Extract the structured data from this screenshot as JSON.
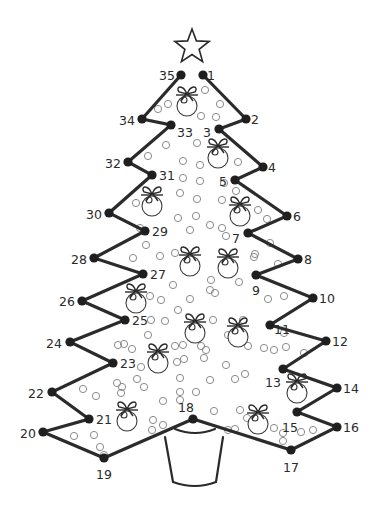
{
  "colors": {
    "line": "#2b2b2b",
    "node": "#1f1f1f",
    "bubble": "#8a8a8a",
    "background": "#ffffff"
  },
  "star": {
    "cx": 192,
    "cy": 47,
    "outer": 18,
    "inner": 7.5
  },
  "dots": [
    {
      "n": "1",
      "x": 203,
      "y": 75,
      "lx": 207,
      "ly": 80,
      "anchor": "start"
    },
    {
      "n": "2",
      "x": 246,
      "y": 119,
      "lx": 251,
      "ly": 124,
      "anchor": "start"
    },
    {
      "n": "3",
      "x": 219,
      "y": 129,
      "lx": 211,
      "ly": 137,
      "anchor": "end"
    },
    {
      "n": "4",
      "x": 263,
      "y": 167,
      "lx": 268,
      "ly": 172,
      "anchor": "start"
    },
    {
      "n": "5",
      "x": 235,
      "y": 180,
      "lx": 227,
      "ly": 186,
      "anchor": "end"
    },
    {
      "n": "6",
      "x": 287,
      "y": 216,
      "lx": 293,
      "ly": 221,
      "anchor": "start"
    },
    {
      "n": "7",
      "x": 248,
      "y": 233,
      "lx": 240,
      "ly": 243,
      "anchor": "end"
    },
    {
      "n": "8",
      "x": 298,
      "y": 259,
      "lx": 304,
      "ly": 264,
      "anchor": "start"
    },
    {
      "n": "9",
      "x": 256,
      "y": 275,
      "lx": 252,
      "ly": 295,
      "anchor": "start"
    },
    {
      "n": "10",
      "x": 313,
      "y": 298,
      "lx": 319,
      "ly": 303,
      "anchor": "start"
    },
    {
      "n": "11",
      "x": 270,
      "y": 325,
      "lx": 274,
      "ly": 334,
      "anchor": "start"
    },
    {
      "n": "12",
      "x": 326,
      "y": 341,
      "lx": 332,
      "ly": 346,
      "anchor": "start"
    },
    {
      "n": "13",
      "x": 283,
      "y": 369,
      "lx": 281,
      "ly": 387,
      "anchor": "end"
    },
    {
      "n": "14",
      "x": 337,
      "y": 388,
      "lx": 343,
      "ly": 393,
      "anchor": "start"
    },
    {
      "n": "15",
      "x": 297,
      "y": 412,
      "lx": 282,
      "ly": 432,
      "anchor": "start"
    },
    {
      "n": "16",
      "x": 337,
      "y": 427,
      "lx": 343,
      "ly": 432,
      "anchor": "start"
    },
    {
      "n": "17",
      "x": 291,
      "y": 450,
      "lx": 291,
      "ly": 472,
      "anchor": "middle"
    },
    {
      "n": "18",
      "x": 193,
      "y": 419,
      "lx": 186,
      "ly": 412,
      "anchor": "middle"
    },
    {
      "n": "19",
      "x": 104,
      "y": 458,
      "lx": 104,
      "ly": 479,
      "anchor": "middle"
    },
    {
      "n": "20",
      "x": 43,
      "y": 432,
      "lx": 36,
      "ly": 438,
      "anchor": "end"
    },
    {
      "n": "21",
      "x": 89,
      "y": 419,
      "lx": 96,
      "ly": 424,
      "anchor": "start"
    },
    {
      "n": "22",
      "x": 52,
      "y": 392,
      "lx": 44,
      "ly": 398,
      "anchor": "end"
    },
    {
      "n": "23",
      "x": 113,
      "y": 363,
      "lx": 120,
      "ly": 368,
      "anchor": "start"
    },
    {
      "n": "24",
      "x": 70,
      "y": 342,
      "lx": 62,
      "ly": 348,
      "anchor": "end"
    },
    {
      "n": "25",
      "x": 125,
      "y": 320,
      "lx": 132,
      "ly": 325,
      "anchor": "start"
    },
    {
      "n": "26",
      "x": 82,
      "y": 301,
      "lx": 75,
      "ly": 306,
      "anchor": "end"
    },
    {
      "n": "27",
      "x": 143,
      "y": 274,
      "lx": 150,
      "ly": 279,
      "anchor": "start"
    },
    {
      "n": "28",
      "x": 94,
      "y": 258,
      "lx": 87,
      "ly": 264,
      "anchor": "end"
    },
    {
      "n": "29",
      "x": 145,
      "y": 231,
      "lx": 152,
      "ly": 236,
      "anchor": "start"
    },
    {
      "n": "30",
      "x": 109,
      "y": 213,
      "lx": 102,
      "ly": 219,
      "anchor": "end"
    },
    {
      "n": "31",
      "x": 152,
      "y": 175,
      "lx": 159,
      "ly": 180,
      "anchor": "start"
    },
    {
      "n": "32",
      "x": 128,
      "y": 162,
      "lx": 121,
      "ly": 168,
      "anchor": "end"
    },
    {
      "n": "33",
      "x": 171,
      "y": 125,
      "lx": 177,
      "ly": 137,
      "anchor": "start"
    },
    {
      "n": "34",
      "x": 142,
      "y": 119,
      "lx": 135,
      "ly": 125,
      "anchor": "end"
    },
    {
      "n": "35",
      "x": 181,
      "y": 75,
      "lx": 175,
      "ly": 80,
      "anchor": "end"
    }
  ],
  "ornaments": [
    {
      "x": 187,
      "y": 106
    },
    {
      "x": 218,
      "y": 158
    },
    {
      "x": 152,
      "y": 206
    },
    {
      "x": 240,
      "y": 216
    },
    {
      "x": 190,
      "y": 266
    },
    {
      "x": 228,
      "y": 268
    },
    {
      "x": 136,
      "y": 303
    },
    {
      "x": 195,
      "y": 333
    },
    {
      "x": 238,
      "y": 337
    },
    {
      "x": 158,
      "y": 363
    },
    {
      "x": 297,
      "y": 393
    },
    {
      "x": 127,
      "y": 421
    },
    {
      "x": 258,
      "y": 424
    }
  ],
  "bubbles": [
    [
      205,
      90
    ],
    [
      220,
      104
    ],
    [
      201,
      116
    ],
    [
      216,
      117
    ],
    [
      168,
      104
    ],
    [
      158,
      109
    ],
    [
      166,
      145
    ],
    [
      197,
      143
    ],
    [
      148,
      156
    ],
    [
      183,
      161
    ],
    [
      200,
      165
    ],
    [
      238,
      162
    ],
    [
      183,
      178
    ],
    [
      200,
      181
    ],
    [
      180,
      193
    ],
    [
      197,
      199
    ],
    [
      136,
      203
    ],
    [
      224,
      183
    ],
    [
      236,
      191
    ],
    [
      222,
      200
    ],
    [
      178,
      218
    ],
    [
      196,
      216
    ],
    [
      258,
      210
    ],
    [
      267,
      219
    ],
    [
      140,
      228
    ],
    [
      190,
      230
    ],
    [
      210,
      225
    ],
    [
      222,
      228
    ],
    [
      226,
      236
    ],
    [
      146,
      245
    ],
    [
      175,
      253
    ],
    [
      160,
      256
    ],
    [
      133,
      258
    ],
    [
      270,
      243
    ],
    [
      255,
      254
    ],
    [
      278,
      264
    ],
    [
      254,
      257
    ],
    [
      173,
      285
    ],
    [
      150,
      296
    ],
    [
      211,
      280
    ],
    [
      239,
      282
    ],
    [
      215,
      293
    ],
    [
      210,
      290
    ],
    [
      190,
      299
    ],
    [
      178,
      310
    ],
    [
      161,
      300
    ],
    [
      151,
      320
    ],
    [
      165,
      321
    ],
    [
      213,
      320
    ],
    [
      268,
      299
    ],
    [
      284,
      296
    ],
    [
      148,
      335
    ],
    [
      201,
      346
    ],
    [
      206,
      350
    ],
    [
      228,
      335
    ],
    [
      243,
      320
    ],
    [
      284,
      333
    ],
    [
      286,
      347
    ],
    [
      274,
      350
    ],
    [
      124,
      344
    ],
    [
      118,
      345
    ],
    [
      132,
      349
    ],
    [
      175,
      346
    ],
    [
      183,
      345
    ],
    [
      141,
      367
    ],
    [
      248,
      346
    ],
    [
      177,
      362
    ],
    [
      184,
      359
    ],
    [
      204,
      358
    ],
    [
      226,
      365
    ],
    [
      264,
      348
    ],
    [
      304,
      353
    ],
    [
      117,
      383
    ],
    [
      122,
      387
    ],
    [
      144,
      387
    ],
    [
      137,
      379
    ],
    [
      180,
      378
    ],
    [
      180,
      392
    ],
    [
      196,
      392
    ],
    [
      210,
      380
    ],
    [
      235,
      379
    ],
    [
      245,
      374
    ],
    [
      83,
      389
    ],
    [
      96,
      396
    ],
    [
      121,
      393
    ],
    [
      163,
      401
    ],
    [
      180,
      400
    ],
    [
      214,
      411
    ],
    [
      240,
      410
    ],
    [
      247,
      418
    ],
    [
      163,
      425
    ],
    [
      152,
      430
    ],
    [
      153,
      420
    ],
    [
      228,
      430
    ],
    [
      235,
      429
    ],
    [
      274,
      428
    ],
    [
      283,
      433
    ],
    [
      301,
      432
    ],
    [
      313,
      430
    ],
    [
      283,
      441
    ],
    [
      74,
      436
    ],
    [
      94,
      435
    ],
    [
      100,
      447
    ],
    [
      104,
      455
    ]
  ],
  "pot": {
    "rim": "M175 429 Q195 437 215 429",
    "body": "M165 437 L173 482 Q195 490 216 482 L223 437"
  }
}
